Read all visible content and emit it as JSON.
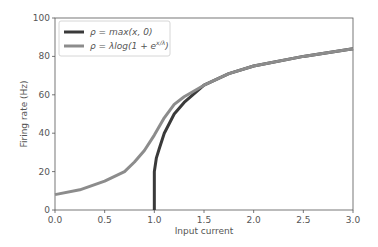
{
  "chart_data": {
    "type": "line",
    "title": "",
    "xlabel": "Input current",
    "ylabel": "Firing rate (Hz)",
    "xlim": [
      0.0,
      3.0
    ],
    "ylim": [
      0,
      100
    ],
    "xticks": [
      "0.0",
      "0.5",
      "1.0",
      "1.5",
      "2.0",
      "2.5",
      "3.0"
    ],
    "yticks": [
      "0",
      "20",
      "40",
      "60",
      "80",
      "100"
    ],
    "grid": false,
    "legend_position": "upper left",
    "series": [
      {
        "name": "ρ = max(x, 0)",
        "color": "#3a3a3a",
        "x": [
          1.0,
          1.0,
          1.02,
          1.05,
          1.1,
          1.2,
          1.3,
          1.5,
          1.75,
          2.0,
          2.5,
          3.0
        ],
        "y": [
          0,
          20,
          27,
          32,
          40,
          50,
          56,
          65,
          71,
          75,
          80,
          84
        ]
      },
      {
        "name": "ρ = λlog(1 + e^{x/λ})",
        "color": "#8c8c8c",
        "x": [
          0.0,
          0.25,
          0.5,
          0.7,
          0.8,
          0.9,
          1.0,
          1.1,
          1.2,
          1.3,
          1.5,
          1.75,
          2.0,
          2.5,
          3.0
        ],
        "y": [
          8,
          10.5,
          15,
          20,
          25,
          31,
          39,
          48,
          55,
          59,
          65,
          71,
          75,
          80,
          84
        ]
      }
    ]
  },
  "legend": {
    "items": [
      {
        "label_prefix": "ρ = ",
        "label_main": "max(x, 0)",
        "color": "#3a3a3a"
      },
      {
        "label_prefix": "ρ = ",
        "label_main": "λlog(1 + e",
        "label_sup": "x/λ",
        "label_suffix": ")",
        "color": "#8c8c8c"
      }
    ]
  }
}
